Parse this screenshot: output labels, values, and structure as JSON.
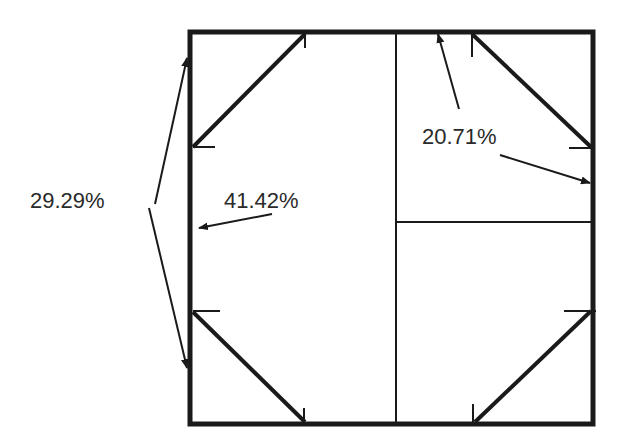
{
  "diagram": {
    "labels": {
      "left_corner": "29.29%",
      "center_side": "41.42%",
      "right_quarter": "20.71%"
    },
    "colors": {
      "stroke": "#1a1a1a",
      "text": "#2a2a2a",
      "background": "#ffffff"
    }
  }
}
